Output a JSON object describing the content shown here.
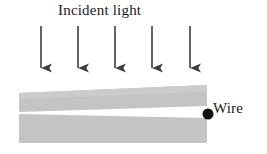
{
  "figure": {
    "type": "physics-optics-diagram",
    "width": 267,
    "height": 154,
    "background_color": "#ffffff",
    "labels": {
      "incident_light": "Incident light",
      "wire": "Wire"
    },
    "colors": {
      "slab_gray": "#c4c4c4",
      "slab_gray_light": "#cbcbcb",
      "wedge_white": "#ffffff",
      "arrow_dark": "#3f3f3f",
      "wire_dot": "#111111",
      "text": "#1a1a1a"
    },
    "arrows": {
      "count": 5,
      "direction": "down",
      "label": "incident light rays",
      "x_positions": [
        41,
        78,
        115,
        152,
        190
      ],
      "y_start": 26,
      "y_end": 79,
      "shaft_width": 1.6,
      "head_width": 8,
      "head_length": 11
    },
    "slab": {
      "label": "glass plate",
      "left": 19,
      "right": 207,
      "top_left_y": 93,
      "top_right_y": 85,
      "bottom_left_y": 143,
      "bottom_right_y": 143
    },
    "wedge": {
      "label": "air wedge",
      "left": 19,
      "right": 207,
      "left_top_y": 112,
      "left_bottom_y": 114,
      "right_top_y": 106,
      "right_bottom_y": 118
    },
    "wire_dot": {
      "cx": 208,
      "cy": 114,
      "r": 5.5
    }
  }
}
